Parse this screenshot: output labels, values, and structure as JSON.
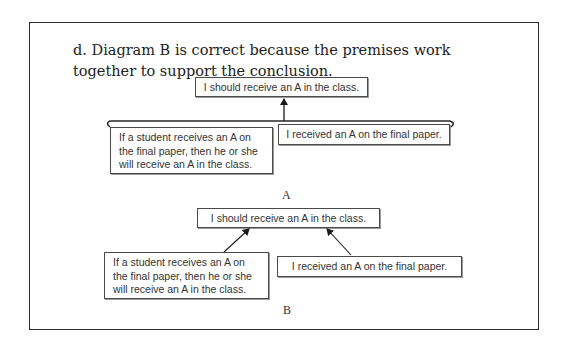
{
  "question": {
    "text": "d.  Diagram B is correct because the premises work together to support the conclusion."
  },
  "diagram_a": {
    "label": "A",
    "conclusion": "I should receive an A in the class.",
    "premise_left": "If a student receives an A on the final paper, then he or she will receive an A in the class.",
    "premise_right": "I received an A on the final paper.",
    "structure": "linked premises (bracketed) with single arrow to conclusion"
  },
  "diagram_b": {
    "label": "B",
    "conclusion": "I should receive an A in the class.",
    "premise_left": "If a student receives an A on the final paper, then he or she will receive an A in the class.",
    "premise_right": "I received an A on the final paper.",
    "structure": "independent premises with separate arrows to conclusion"
  },
  "colors": {
    "text": "#222222",
    "box_border": "#4a4a4a",
    "frame_border": "#2a2a2a",
    "background": "#ffffff"
  }
}
